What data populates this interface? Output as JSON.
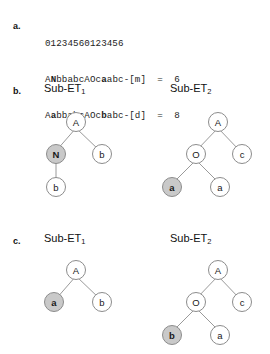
{
  "figure": {
    "sections": [
      {
        "id": "a",
        "label": "a."
      },
      {
        "id": "b",
        "label": "b."
      },
      {
        "id": "c",
        "label": "c."
      }
    ]
  },
  "part_a": {
    "index_ruler": "01234560123456",
    "lines": [
      {
        "id": "line-m",
        "segments": [
          {
            "text": "A",
            "bold": false
          },
          {
            "text": "N",
            "bold": true
          },
          {
            "text": "bbabcAOc",
            "bold": false
          },
          {
            "text": "a",
            "bold": true
          },
          {
            "text": "abc-[m]  =  6",
            "bold": false
          }
        ],
        "plain": "ANbbabcAOcaabc-[m]  =  6",
        "operator": "[m]",
        "position": "6"
      },
      {
        "id": "line-d",
        "segments": [
          {
            "text": "A",
            "bold": false
          },
          {
            "text": "a",
            "bold": true
          },
          {
            "text": "bbabcAOc",
            "bold": false
          },
          {
            "text": "b",
            "bold": true
          },
          {
            "text": "abc-[d]  =  8",
            "bold": false
          }
        ],
        "plain": "AabbabcAOcbabc-[d]  =  8",
        "operator": "[d]",
        "position": "8"
      }
    ]
  },
  "part_b": {
    "trees": [
      {
        "id": "b-sub-et-1",
        "caption_main": "Sub-ET",
        "caption_sub": "1",
        "nodes": [
          {
            "id": "b1-root",
            "label": "A",
            "marked": false,
            "bold": false
          },
          {
            "id": "b1-n",
            "label": "N",
            "marked": true,
            "bold": true
          },
          {
            "id": "b1-b1",
            "label": "b",
            "marked": false,
            "bold": false
          },
          {
            "id": "b1-b2",
            "label": "b",
            "marked": false,
            "bold": false
          }
        ]
      },
      {
        "id": "b-sub-et-2",
        "caption_main": "Sub-ET",
        "caption_sub": "2",
        "nodes": [
          {
            "id": "b2-root",
            "label": "A",
            "marked": false,
            "bold": false
          },
          {
            "id": "b2-o",
            "label": "O",
            "marked": false,
            "bold": false
          },
          {
            "id": "b2-c",
            "label": "c",
            "marked": false,
            "bold": false
          },
          {
            "id": "b2-a1",
            "label": "a",
            "marked": true,
            "bold": true
          },
          {
            "id": "b2-a2",
            "label": "a",
            "marked": false,
            "bold": false
          }
        ]
      }
    ]
  },
  "part_c": {
    "trees": [
      {
        "id": "c-sub-et-1",
        "caption_main": "Sub-ET",
        "caption_sub": "1",
        "nodes": [
          {
            "id": "c1-root",
            "label": "A",
            "marked": false,
            "bold": false
          },
          {
            "id": "c1-a",
            "label": "a",
            "marked": true,
            "bold": true
          },
          {
            "id": "c1-b",
            "label": "b",
            "marked": false,
            "bold": false
          }
        ]
      },
      {
        "id": "c-sub-et-2",
        "caption_main": "Sub-ET",
        "caption_sub": "2",
        "nodes": [
          {
            "id": "c2-root",
            "label": "A",
            "marked": false,
            "bold": false
          },
          {
            "id": "c2-o",
            "label": "O",
            "marked": false,
            "bold": false
          },
          {
            "id": "c2-c",
            "label": "c",
            "marked": false,
            "bold": false
          },
          {
            "id": "c2-b",
            "label": "b",
            "marked": true,
            "bold": true
          },
          {
            "id": "c2-a",
            "label": "a",
            "marked": false,
            "bold": false
          }
        ]
      }
    ]
  },
  "colors": {
    "node_fill": "#ffffff",
    "node_marked_fill": "#c9c9c9",
    "node_stroke": "#8c8c8c",
    "edge": "#9a9a9a",
    "text": "#1a1a1a",
    "background": "#ffffff"
  }
}
